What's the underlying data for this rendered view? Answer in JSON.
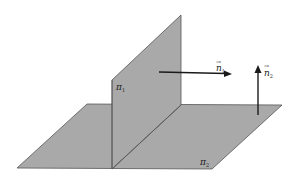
{
  "diagram": {
    "planes": [
      {
        "id": "pi1",
        "label": "π",
        "subscript": "1",
        "orientation": "vertical"
      },
      {
        "id": "pi2",
        "label": "π",
        "subscript": "2",
        "orientation": "horizontal"
      }
    ],
    "vectors": [
      {
        "id": "n1",
        "label": "n",
        "subscript": "1",
        "vector_mark": "→",
        "direction": "right"
      },
      {
        "id": "n2",
        "label": "n",
        "subscript": "2",
        "vector_mark": "→",
        "direction": "up"
      }
    ],
    "colors": {
      "plane_fill": "#a9a9a9",
      "plane_edge": "#555555",
      "arrow": "#1a1a1a",
      "background": "#ffffff"
    }
  }
}
